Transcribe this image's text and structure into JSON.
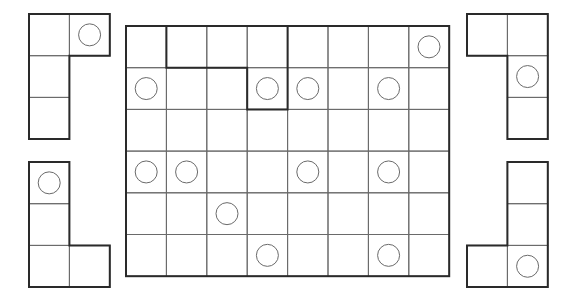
{
  "puzzle": {
    "board": {
      "cols": 8,
      "rows": 6,
      "origin": [
        126,
        26
      ],
      "cell_w": 40.4,
      "cell_h": 41.7,
      "circles": [
        [
          0,
          7
        ],
        [
          1,
          0
        ],
        [
          1,
          3
        ],
        [
          1,
          4
        ],
        [
          1,
          6
        ],
        [
          3,
          0
        ],
        [
          3,
          1
        ],
        [
          3,
          4
        ],
        [
          3,
          6
        ],
        [
          4,
          2
        ],
        [
          5,
          3
        ],
        [
          5,
          6
        ]
      ],
      "outlined_region": [
        [
          0,
          1
        ],
        [
          0,
          2
        ],
        [
          0,
          3
        ],
        [
          1,
          3
        ]
      ]
    },
    "pieces": [
      {
        "name": "piece-top-left",
        "origin": [
          29,
          14
        ],
        "cells": [
          [
            0,
            0
          ],
          [
            0,
            1
          ],
          [
            1,
            0
          ],
          [
            2,
            0
          ]
        ],
        "circles": [
          [
            0,
            1
          ]
        ]
      },
      {
        "name": "piece-bottom-left",
        "origin": [
          29,
          162
        ],
        "cells": [
          [
            0,
            0
          ],
          [
            1,
            0
          ],
          [
            2,
            0
          ],
          [
            2,
            1
          ]
        ],
        "circles": [
          [
            0,
            0
          ]
        ]
      },
      {
        "name": "piece-top-right",
        "origin": [
          467,
          14
        ],
        "cells": [
          [
            0,
            0
          ],
          [
            0,
            1
          ],
          [
            1,
            1
          ],
          [
            2,
            1
          ]
        ],
        "circles": [
          [
            1,
            1
          ]
        ]
      },
      {
        "name": "piece-bottom-right",
        "origin": [
          467,
          162
        ],
        "cells": [
          [
            0,
            1
          ],
          [
            1,
            1
          ],
          [
            2,
            1
          ],
          [
            2,
            0
          ]
        ],
        "circles": [
          [
            2,
            1
          ]
        ]
      }
    ],
    "colors": {
      "line": "#6a6a6a",
      "border": "#2a2a2a",
      "background": "#ffffff"
    }
  }
}
